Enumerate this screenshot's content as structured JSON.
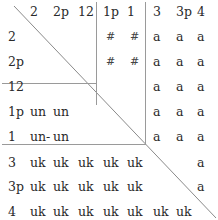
{
  "table": {
    "column_headers": [
      "2",
      "2p",
      "12",
      "1p",
      "1",
      "3",
      "3p",
      "4"
    ],
    "row_headers": [
      "2",
      "2p",
      "12",
      "1p",
      "1",
      "3",
      "3p",
      "4"
    ],
    "rows": [
      [
        "",
        "",
        "",
        "#",
        "#",
        "a",
        "a",
        "a"
      ],
      [
        "",
        "",
        "",
        "#",
        "#",
        "a",
        "a",
        "a"
      ],
      [
        "",
        "",
        "",
        "",
        "",
        "a",
        "a",
        "a"
      ],
      [
        "un",
        "un",
        "",
        "",
        "",
        "a",
        "a",
        "a"
      ],
      [
        "un-",
        "un",
        "",
        "",
        "",
        "a",
        "a",
        "a"
      ],
      [
        "uk",
        "uk",
        "uk",
        "uk",
        "uk",
        "",
        "",
        "a"
      ],
      [
        "uk",
        "uk",
        "uk",
        "uk",
        "uk",
        "",
        "",
        "a"
      ],
      [
        "uk",
        "uk",
        "uk",
        "uk",
        "uk",
        "uk",
        "uk",
        ""
      ]
    ]
  }
}
